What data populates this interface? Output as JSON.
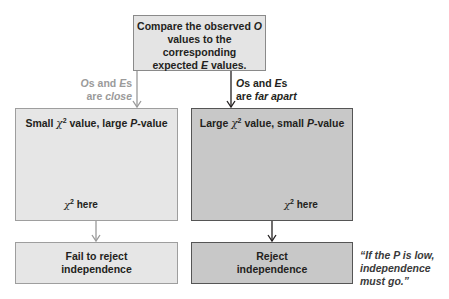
{
  "diagram": {
    "top_box": {
      "line1": "Compare the observed",
      "line1_var": "O",
      "line2": "values to the corresponding",
      "line3_pre": "expected",
      "line3_var": "E",
      "line3_post": "values."
    },
    "left_branch": {
      "label_line1_var1": "O",
      "label_line1_mid": "s and",
      "label_line1_var2": "E",
      "label_line1_end": "s",
      "label_line2_pre": "are",
      "label_line2_emph": "close",
      "panel_title_pre": "Small",
      "panel_title_symbol": "χ",
      "panel_title_sup": "2",
      "panel_title_mid": "value, large",
      "panel_title_var": "P",
      "panel_title_post": "-value",
      "chart_label_symbol": "χ",
      "chart_label_sup": "2",
      "chart_label_text": "here",
      "result_line1": "Fail to reject",
      "result_line2": "independence",
      "color_fill": "#e6e6e6",
      "color_border": "#9e9e9e"
    },
    "right_branch": {
      "label_line1_var1": "O",
      "label_line1_mid": "s and",
      "label_line1_var2": "E",
      "label_line1_end": "s",
      "label_line2_pre": "are",
      "label_line2_emph": "far apart",
      "panel_title_pre": "Large",
      "panel_title_symbol": "χ",
      "panel_title_sup": "2",
      "panel_title_mid": "value, small",
      "panel_title_var": "P",
      "panel_title_post": "-value",
      "chart_label_symbol": "χ",
      "chart_label_sup": "2",
      "chart_label_text": "here",
      "result_line1": "Reject",
      "result_line2": "independence",
      "color_fill": "#c8c8c8",
      "color_border": "#555555"
    },
    "quote": {
      "line1": "“If the P is low,",
      "line2": "independence",
      "line3": "must go.”"
    }
  }
}
